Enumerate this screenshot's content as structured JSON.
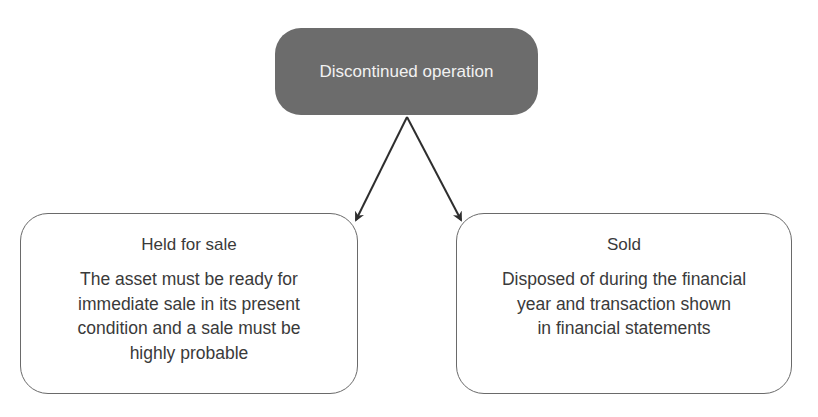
{
  "diagram": {
    "root": {
      "label": "Discontinued operation",
      "fill_color": "#6c6c6c"
    },
    "children": [
      {
        "title": "Held for sale",
        "body_lines": [
          "The asset must be ready for",
          "immediate sale in its present",
          "condition and a sale must be",
          "highly probable"
        ]
      },
      {
        "title": "Sold",
        "body_lines": [
          "Disposed of during the financial",
          "year and transaction shown",
          "in financial statements"
        ]
      }
    ],
    "edges": [
      {
        "from": "Discontinued operation",
        "to": "Held for sale"
      },
      {
        "from": "Discontinued operation",
        "to": "Sold"
      }
    ]
  }
}
